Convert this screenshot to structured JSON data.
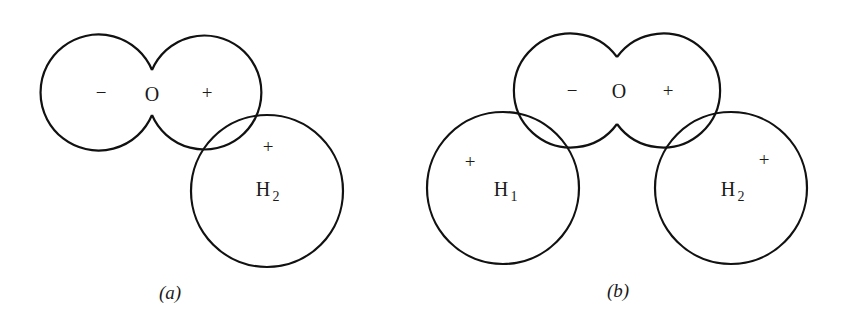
{
  "figure": {
    "panels": [
      {
        "id": "a",
        "caption": "(a)",
        "oxygen": {
          "label": "O",
          "left_lobe_sign": "−",
          "right_lobe_sign": "+"
        },
        "hydrogens": [
          {
            "label": "H",
            "subscript": "2",
            "sign": "+"
          }
        ]
      },
      {
        "id": "b",
        "caption": "(b)",
        "oxygen": {
          "label": "O",
          "left_lobe_sign": "−",
          "right_lobe_sign": "+"
        },
        "hydrogens": [
          {
            "label": "H",
            "subscript": "1",
            "sign": "+"
          },
          {
            "label": "H",
            "subscript": "2",
            "sign": "+"
          }
        ]
      }
    ],
    "colors": {
      "stroke": "#111111",
      "background": "#ffffff"
    }
  }
}
